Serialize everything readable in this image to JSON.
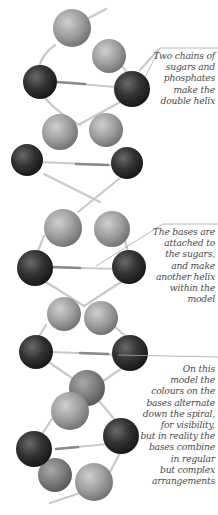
{
  "diagram": {
    "colors": {
      "sugar_ball": "#9a9a9a",
      "base_ball_dark": "#2e2e2e",
      "rod": "#c8c8c8",
      "leader_line": "#9a9a9a",
      "caption_text": "#4a4a4a"
    },
    "captions": [
      {
        "id": "chains",
        "lines": [
          "Two chains of",
          "sugars and",
          "phosphates",
          "make the",
          "double helix"
        ]
      },
      {
        "id": "bases",
        "lines": [
          "The bases are",
          "attached to",
          "the sugars,",
          "and make",
          "another helix",
          "within the",
          "model"
        ]
      },
      {
        "id": "colours",
        "lines": [
          "On this",
          "model the",
          "colours on the",
          "bases alternate",
          "down the spiral,",
          "for visibility,",
          "but in reality the",
          "bases combine",
          "in regular",
          "but complex",
          "arrangements"
        ]
      }
    ]
  }
}
